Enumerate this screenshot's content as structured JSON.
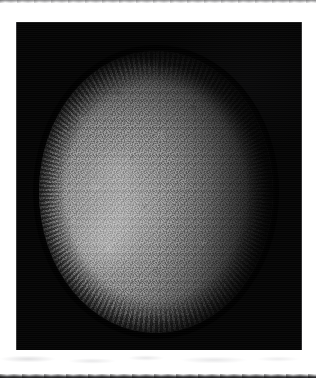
{
  "page": {
    "background_color": "#ffffff",
    "width": 316,
    "height": 378
  },
  "plate": {
    "label": "astronomical disk plate",
    "background_color": "#040404",
    "left": 16,
    "top": 22,
    "width": 286,
    "height": 328
  },
  "disk": {
    "label": "illuminated stellar disk",
    "center_x": 156,
    "center_y": 192,
    "radius_x": 117,
    "radius_y": 141,
    "bright_color": "#adadad",
    "mid_color": "#858585",
    "limb_color": "#1a1a1a",
    "brightest_region": "left-of-center",
    "darkest_limb": "right",
    "texture": "granular photographic noise"
  },
  "artifacts": {
    "top_scan_line": "faint gray scanner streak",
    "bottom_scan_line": "dark page-edge shadow band",
    "margin_smudges": "light gray scan smudges in lower white margin"
  }
}
